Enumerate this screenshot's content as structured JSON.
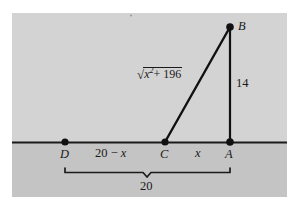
{
  "figure": {
    "kind": "geometry-diagram",
    "colors": {
      "page_background": "#ffffff",
      "upper_region": "#d3d3d3",
      "lower_region": "#c4c4c4",
      "stroke": "#1a1a1a",
      "point_fill": "#111111"
    },
    "panel": {
      "x": 12,
      "y": 13,
      "width": 275,
      "height": 184
    },
    "horizon_line_y": 142,
    "points": [
      {
        "id": "A",
        "label": "A",
        "x": 230,
        "y": 142,
        "label_x": 226,
        "label_y": 148
      },
      {
        "id": "B",
        "label": "B",
        "x": 230,
        "y": 27,
        "label_x": 238,
        "label_y": 21
      },
      {
        "id": "C",
        "label": "C",
        "x": 165,
        "y": 142,
        "label_x": 161,
        "label_y": 148
      },
      {
        "id": "D",
        "label": "D",
        "x": 65,
        "y": 142,
        "label_x": 61,
        "label_y": 148
      }
    ],
    "segments": [
      {
        "name": "segment-CB",
        "from": "C",
        "to": "B"
      },
      {
        "name": "segment-AB",
        "from": "A",
        "to": "B"
      }
    ],
    "labels": {
      "hypotenuse": {
        "text": "sqrt(x^2 + 196)",
        "radical_symbol": "√",
        "radicand_base": "x",
        "radicand_exponent": "2",
        "radicand_rest": "+ 196",
        "x": 136,
        "y": 67
      },
      "vertical_side": {
        "text": "14",
        "x": 236,
        "y": 78
      },
      "left_span": {
        "text": "20 − x",
        "base": "20 − ",
        "variable": "x",
        "x": 96,
        "y": 147
      },
      "right_span": {
        "text": "x",
        "x": 196,
        "y": 147
      },
      "total_span": {
        "text": "20",
        "x": 141,
        "y": 181
      }
    },
    "brace": {
      "name": "underbrace",
      "left_x": 65,
      "right_x": 230,
      "y": 168,
      "tick_y": 176,
      "center_x": 147
    }
  }
}
